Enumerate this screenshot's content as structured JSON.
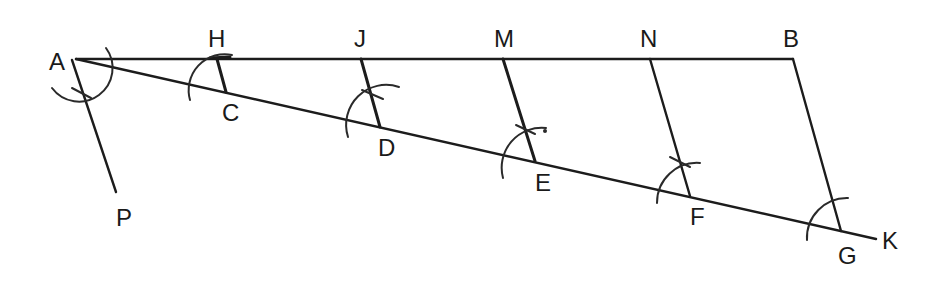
{
  "diagram": {
    "type": "geometric-construction",
    "points": {
      "A": {
        "label": "A",
        "x": 76,
        "y": 59
      },
      "H": {
        "label": "H",
        "x": 217,
        "y": 59
      },
      "J": {
        "label": "J",
        "x": 361,
        "y": 59
      },
      "M": {
        "label": "M",
        "x": 503,
        "y": 59
      },
      "N": {
        "label": "N",
        "x": 650,
        "y": 59
      },
      "B": {
        "label": "B",
        "x": 793,
        "y": 59
      },
      "C": {
        "label": "C",
        "x": 226,
        "y": 92
      },
      "D": {
        "label": "D",
        "x": 380,
        "y": 127
      },
      "E": {
        "label": "E",
        "x": 535,
        "y": 161
      },
      "F": {
        "label": "F",
        "x": 690,
        "y": 196
      },
      "G": {
        "label": "G",
        "x": 841,
        "y": 231
      },
      "K": {
        "label": "K",
        "x": 876,
        "y": 239
      },
      "P": {
        "label": "P",
        "x": 116,
        "y": 192
      }
    },
    "segments": [
      {
        "from": "A",
        "to": "B"
      },
      {
        "from": "A",
        "to": "K"
      },
      {
        "from": "A",
        "to": "P"
      },
      {
        "from": "H",
        "to": "C"
      },
      {
        "from": "J",
        "to": "D"
      },
      {
        "from": "M",
        "to": "E"
      },
      {
        "from": "N",
        "to": "F"
      },
      {
        "from": "B",
        "to": "G"
      }
    ],
    "labels": {
      "A": "A",
      "H": "H",
      "J": "J",
      "M": "M",
      "N": "N",
      "B": "B",
      "C": "C",
      "D": "D",
      "E": "E",
      "F": "F",
      "G": "G",
      "K": "K",
      "P": "P"
    }
  }
}
